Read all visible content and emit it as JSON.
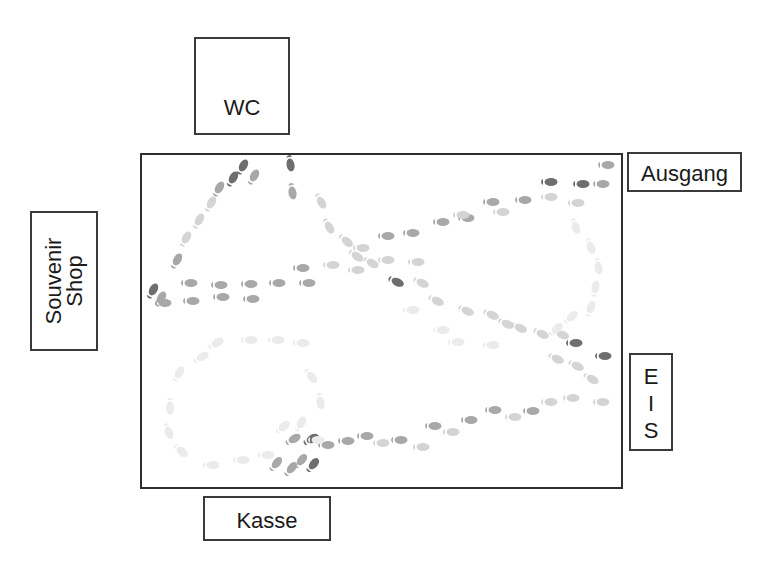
{
  "diagram": {
    "title": "",
    "room": {
      "name": "hall"
    },
    "areas": {
      "wc": {
        "label": "WC"
      },
      "ausgang": {
        "label": "Ausgang"
      },
      "eis": {
        "label": "E\nI\nS"
      },
      "kasse": {
        "label": "Kasse"
      },
      "souvenir_shop": {
        "label": "Souvenir\nShop"
      }
    },
    "colors": {
      "border": "#2e2e2e",
      "dark_print": "#6e6e6e",
      "mid_print": "#a8a8a8",
      "light_print": "#d4d4d4",
      "faint_print": "#ebebeb"
    },
    "footprint_paths": [
      {
        "name": "souvenir-to-wc-upper",
        "shade": "mid",
        "points": [
          [
            152,
            292,
            -60,
            "dark"
          ],
          [
            160,
            300,
            -60,
            "mid"
          ],
          [
            176,
            262,
            -60,
            "mid"
          ],
          [
            185,
            240,
            -60,
            "light"
          ],
          [
            198,
            222,
            -60,
            "light"
          ],
          [
            210,
            205,
            -60,
            "light"
          ],
          [
            218,
            190,
            -60,
            "mid"
          ],
          [
            232,
            180,
            -60,
            "dark"
          ],
          [
            242,
            168,
            -60,
            "dark"
          ],
          [
            253,
            178,
            -60,
            "mid"
          ]
        ]
      },
      {
        "name": "wc-down",
        "shade": "mid",
        "points": [
          [
            290,
            162,
            80,
            "dark"
          ],
          [
            292,
            190,
            80,
            "mid"
          ],
          [
            320,
            200,
            60,
            "light"
          ],
          [
            328,
            225,
            60,
            "light"
          ],
          [
            345,
            240,
            40,
            "light"
          ],
          [
            355,
            255,
            35,
            "light"
          ],
          [
            370,
            262,
            30,
            "light"
          ]
        ]
      },
      {
        "name": "row-left-upper",
        "shade": "mid",
        "points": [
          [
            188,
            283,
            0,
            "mid"
          ],
          [
            218,
            285,
            0,
            "mid"
          ],
          [
            248,
            284,
            0,
            "mid"
          ],
          [
            276,
            283,
            0,
            "mid"
          ],
          [
            306,
            283,
            0,
            "mid"
          ],
          [
            300,
            268,
            0,
            "mid"
          ],
          [
            330,
            265,
            0,
            "light"
          ]
        ]
      },
      {
        "name": "row-left-lower",
        "shade": "mid",
        "points": [
          [
            162,
            303,
            0,
            "mid"
          ],
          [
            190,
            301,
            0,
            "mid"
          ],
          [
            220,
            297,
            0,
            "mid"
          ],
          [
            250,
            299,
            0,
            "mid"
          ]
        ]
      },
      {
        "name": "diagonal-to-ausgang",
        "shade": "light",
        "points": [
          [
            360,
            248,
            0,
            "light"
          ],
          [
            385,
            236,
            0,
            "mid"
          ],
          [
            410,
            233,
            0,
            "mid"
          ],
          [
            440,
            222,
            0,
            "mid"
          ],
          [
            465,
            218,
            0,
            "mid"
          ],
          [
            490,
            202,
            0,
            "mid"
          ],
          [
            522,
            200,
            0,
            "mid"
          ],
          [
            548,
            197,
            0,
            "light"
          ],
          [
            575,
            203,
            0,
            "light"
          ],
          [
            548,
            182,
            0,
            "dark"
          ],
          [
            580,
            184,
            0,
            "dark"
          ],
          [
            600,
            184,
            0,
            "mid"
          ],
          [
            605,
            165,
            0,
            "mid"
          ]
        ]
      },
      {
        "name": "mid-row",
        "shade": "light",
        "points": [
          [
            355,
            270,
            0,
            "light"
          ],
          [
            385,
            260,
            0,
            "light"
          ],
          [
            415,
            262,
            0,
            "light"
          ],
          [
            460,
            215,
            0,
            "light"
          ],
          [
            500,
            212,
            0,
            "light"
          ]
        ]
      },
      {
        "name": "diagonal-to-eis",
        "shade": "light",
        "points": [
          [
            395,
            281,
            25,
            "dark"
          ],
          [
            420,
            282,
            25,
            "light"
          ],
          [
            435,
            300,
            25,
            "light"
          ],
          [
            465,
            310,
            25,
            "light"
          ],
          [
            490,
            314,
            25,
            "light"
          ],
          [
            505,
            323,
            25,
            "light"
          ],
          [
            518,
            327,
            25,
            "light"
          ],
          [
            540,
            333,
            25,
            "light"
          ],
          [
            560,
            334,
            20,
            "light"
          ],
          [
            573,
            343,
            0,
            "dark"
          ],
          [
            602,
            356,
            0,
            "dark"
          ],
          [
            555,
            358,
            25,
            "light"
          ],
          [
            575,
            365,
            25,
            "light"
          ],
          [
            590,
            378,
            30,
            "light"
          ]
        ]
      },
      {
        "name": "lower-sweep",
        "shade": "mid",
        "points": [
          [
            292,
            440,
            -30,
            "mid"
          ],
          [
            310,
            440,
            -30,
            "dark"
          ],
          [
            325,
            445,
            0,
            "mid"
          ],
          [
            345,
            441,
            0,
            "mid"
          ],
          [
            364,
            436,
            0,
            "mid"
          ],
          [
            380,
            443,
            0,
            "light"
          ],
          [
            398,
            440,
            0,
            "mid"
          ],
          [
            420,
            447,
            0,
            "light"
          ],
          [
            432,
            426,
            0,
            "mid"
          ],
          [
            450,
            432,
            0,
            "light"
          ],
          [
            468,
            420,
            0,
            "mid"
          ],
          [
            492,
            410,
            0,
            "mid"
          ],
          [
            512,
            417,
            0,
            "light"
          ],
          [
            530,
            411,
            0,
            "mid"
          ],
          [
            548,
            402,
            0,
            "light"
          ],
          [
            570,
            398,
            0,
            "light"
          ],
          [
            600,
            402,
            0,
            "light"
          ]
        ]
      },
      {
        "name": "kasse-cluster",
        "shade": "dark",
        "points": [
          [
            275,
            465,
            -50,
            "mid"
          ],
          [
            290,
            470,
            -50,
            "mid"
          ],
          [
            300,
            462,
            -50,
            "mid"
          ],
          [
            312,
            466,
            -50,
            "dark"
          ]
        ]
      },
      {
        "name": "faint-loop",
        "shade": "faint",
        "points": [
          [
            215,
            344,
            -30,
            "faint"
          ],
          [
            248,
            340,
            0,
            "faint"
          ],
          [
            275,
            340,
            0,
            "faint"
          ],
          [
            300,
            343,
            0,
            "faint"
          ],
          [
            200,
            358,
            -30,
            "faint"
          ],
          [
            178,
            375,
            -60,
            "faint"
          ],
          [
            170,
            405,
            90,
            "faint"
          ],
          [
            168,
            430,
            70,
            "faint"
          ],
          [
            180,
            450,
            40,
            "faint"
          ],
          [
            210,
            465,
            0,
            "faint"
          ],
          [
            240,
            460,
            0,
            "faint"
          ],
          [
            265,
            455,
            0,
            "faint"
          ],
          [
            282,
            428,
            -40,
            "faint"
          ],
          [
            310,
            375,
            50,
            "faint"
          ],
          [
            320,
            400,
            80,
            "faint"
          ],
          [
            300,
            425,
            -60,
            "faint"
          ],
          [
            315,
            440,
            0,
            "faint"
          ]
        ]
      },
      {
        "name": "faint-right-loop",
        "shade": "faint",
        "points": [
          [
            575,
            225,
            70,
            "faint"
          ],
          [
            590,
            245,
            70,
            "faint"
          ],
          [
            598,
            265,
            80,
            "faint"
          ],
          [
            595,
            290,
            -80,
            "faint"
          ],
          [
            590,
            310,
            -70,
            "faint"
          ],
          [
            570,
            318,
            -40,
            "faint"
          ],
          [
            555,
            330,
            -40,
            "faint"
          ],
          [
            410,
            310,
            0,
            "faint"
          ],
          [
            440,
            330,
            0,
            "faint"
          ],
          [
            455,
            342,
            0,
            "faint"
          ],
          [
            490,
            345,
            0,
            "faint"
          ]
        ]
      }
    ]
  }
}
